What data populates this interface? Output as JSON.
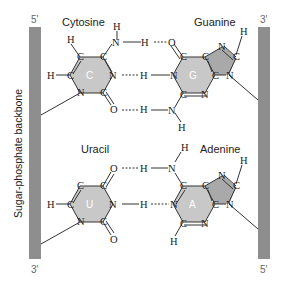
{
  "figure": {
    "backbone_label": "Sugar-phosphate backbone",
    "left_strand": {
      "top": "5'",
      "bottom": "3'"
    },
    "right_strand": {
      "top": "3'",
      "bottom": "5'"
    },
    "colors": {
      "backbone": "#8e8e8e",
      "ring_fill": "#c8c8c8",
      "pentagon_fill": "#a9a9a9",
      "line": "#333333",
      "text": "#222222"
    }
  },
  "pairs": [
    {
      "left": {
        "name": "Cytosine",
        "abbr": "C"
      },
      "right": {
        "name": "Guanine",
        "abbr": "G"
      },
      "hbonds": 3
    },
    {
      "left": {
        "name": "Uracil",
        "abbr": "U"
      },
      "right": {
        "name": "Adenine",
        "abbr": "A"
      },
      "hbonds": 2
    }
  ],
  "atoms": {
    "H": "H",
    "C": "C",
    "N": "N",
    "O": "O"
  }
}
